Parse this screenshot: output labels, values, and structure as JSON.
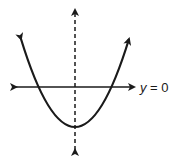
{
  "diagram": {
    "type": "parabola-graph",
    "curve": {
      "shape": "upward-opening parabola",
      "vertex_below_axis": true,
      "x_intercepts": 2
    },
    "horizontal_line": {
      "label_var": "y",
      "label_rest": " = 0",
      "label": "y = 0"
    },
    "axis_of_symmetry": {
      "style": "dashed",
      "orientation": "vertical"
    },
    "colors": {
      "stroke": "#1a1a1a",
      "background": "#ffffff"
    }
  }
}
